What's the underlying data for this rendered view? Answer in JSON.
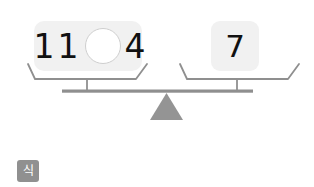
{
  "scene": {
    "type": "balance-scale",
    "state": "balanced",
    "colors": {
      "card_background": "#f1f1f1",
      "numeral": "#111111",
      "scale_gray": "#949494",
      "beam_gray": "#8f8f8f",
      "blank_circle_fill": "#ffffff",
      "blank_circle_border": "#cfcfcf",
      "button_background": "#909090",
      "page_background": "#ffffff"
    }
  },
  "left_pan": {
    "card": {
      "left_operand": "11",
      "blank": "",
      "blank_icon": "empty-circle-icon",
      "right_operand": "4"
    }
  },
  "right_pan": {
    "card": {
      "result": "7"
    }
  },
  "scale_parts": {
    "fulcrum_icon": "triangle-fulcrum-icon",
    "beam_icon": "balance-beam-icon",
    "left_pan_icon": "scale-pan-icon",
    "right_pan_icon": "scale-pan-icon"
  },
  "toolbar": {
    "equation_button_label": "식",
    "equation_button_icon": "equation-icon"
  }
}
